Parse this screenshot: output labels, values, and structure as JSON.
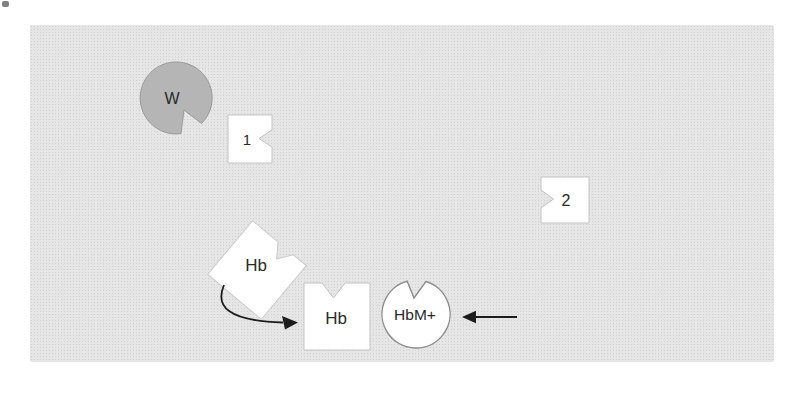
{
  "figure": {
    "description_labels": {
      "w_circle": "W",
      "square_1": "1",
      "square_2": "2",
      "hb_tilted": "Hb",
      "hb_square": "Hb",
      "hbm_circle": "HbM+"
    },
    "colors": {
      "panel_background": "#e6e6e6",
      "w_circle_fill": "#b5b5b5",
      "w_circle_stroke": "#9a9a9a",
      "white_shape_fill": "#ffffff",
      "white_shape_stroke": "#c4c4c4",
      "circle_stroke": "#8c8c8c",
      "arrow_color": "#1c1c1c",
      "label_color": "#2a2a2a"
    }
  }
}
